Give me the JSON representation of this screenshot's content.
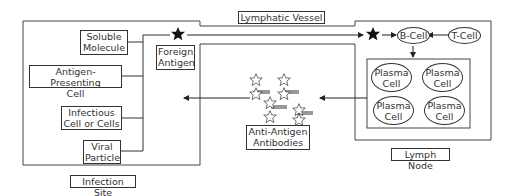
{
  "diagram": {
    "regions": {
      "infection_site": "Infection Site",
      "lymphatic_vessel": "Lymphatic Vessel",
      "lymph_node": "Lymph Node"
    },
    "antigen_sources": [
      {
        "line1": "Soluble",
        "line2": "Molecule"
      },
      {
        "line1": "Antigen-Presenting",
        "line2": "Cell"
      },
      {
        "line1": "Infectious",
        "line2": "Cell or Cells"
      },
      {
        "line1": "Viral",
        "line2": "Particle"
      }
    ],
    "foreign_antigen": {
      "line1": "Foreign",
      "line2": "Antigen"
    },
    "b_cell": "B-Cell",
    "t_cell": "T-Cell",
    "plasma_cells": [
      {
        "line1": "Plasma",
        "line2": "Cell"
      },
      {
        "line1": "Plasma",
        "line2": "Cell"
      },
      {
        "line1": "Plasma",
        "line2": "Cell"
      },
      {
        "line1": "Plasma",
        "line2": "Cell"
      }
    ],
    "antibodies": {
      "line1": "Anti-Antigen",
      "line2": "Antibodies"
    },
    "icons": {
      "antigen": "filled-star-icon",
      "antibody_antigen_complex": "outline-star-icon"
    }
  }
}
